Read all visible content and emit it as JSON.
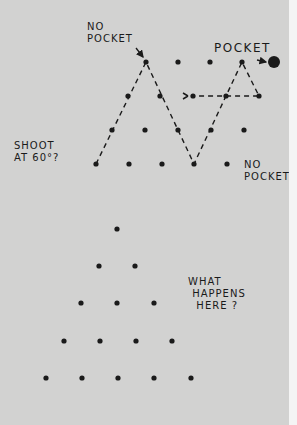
{
  "labels": {
    "no_pocket_top": "NO\nPOCKET",
    "pocket": "POCKET",
    "shoot_question": "SHOOT\nAT 60°?",
    "no_pocket_right": "NO\nPOCKET",
    "what_happens": "WHAT\n HAPPENS\n  HERE ?"
  },
  "colors": {
    "background": "#d2d2d1",
    "ink": "#1a1a1a"
  },
  "top_grid": {
    "rows": [
      {
        "y": 62,
        "x": [
          146,
          178,
          210,
          242
        ]
      },
      {
        "y": 96,
        "x": [
          128,
          160,
          193,
          226,
          259
        ]
      },
      {
        "y": 130,
        "x": [
          112,
          145,
          178,
          211,
          244
        ]
      },
      {
        "y": 164,
        "x": [
          96,
          129,
          162,
          194,
          227
        ]
      }
    ],
    "pocket": {
      "x": 274,
      "y": 62,
      "r": 6
    }
  },
  "bottom_triangle": {
    "rows": [
      {
        "y": 229,
        "x": [
          117
        ]
      },
      {
        "y": 266,
        "x": [
          99,
          135
        ]
      },
      {
        "y": 303,
        "x": [
          81,
          117,
          154
        ]
      },
      {
        "y": 341,
        "x": [
          64,
          100,
          136,
          172
        ]
      },
      {
        "y": 378,
        "x": [
          46,
          82,
          118,
          154,
          191
        ]
      }
    ]
  }
}
